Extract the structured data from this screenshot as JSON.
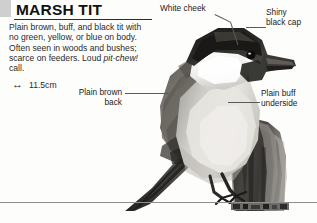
{
  "page": {
    "background_color": "#fdfdfc",
    "tab_marker_color": "#cfcfcf",
    "rule_color": "#2b2b2b",
    "leader_color": "#5a5a5a"
  },
  "header": {
    "title": "MARSH TIT"
  },
  "description": {
    "line_1": "Plain brown, buff, and black tit",
    "line_2": "with no green, yellow, or blue on",
    "line_3": "body. Often seen in woods and",
    "line_4": "bushes; scarce on feeders. Loud",
    "line_5_italic": "pit-chew!",
    "line_5_tail": " call.",
    "full_text": "Plain brown, buff, and black tit with no green, yellow, or blue on body. Often seen in woods and bushes; scarce on feeders. Loud pit-chew! call."
  },
  "size": {
    "icon": "double-headed-arrow-icon",
    "glyph": "↔",
    "value": "11.5cm"
  },
  "callouts": [
    {
      "id": "white-cheek",
      "label_line_1": "White cheek",
      "label_line_2": ""
    },
    {
      "id": "shiny-black-cap",
      "label_line_1": "Shiny",
      "label_line_2": "black cap"
    },
    {
      "id": "plain-brown-back",
      "label_line_1": "Plain brown",
      "label_line_2": "back"
    },
    {
      "id": "plain-buff-under",
      "label_line_1": "Plain buff",
      "label_line_2": "underside"
    }
  ],
  "illustration": {
    "subject": "marsh-tit-photograph",
    "perch": "weathered wooden post",
    "palette": "grayscale"
  }
}
